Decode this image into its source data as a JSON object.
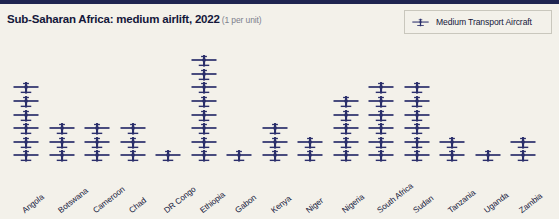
{
  "header": {
    "title": "Sub-Saharan Africa: medium airlift, 2022",
    "subtitle": "(1 per unit)"
  },
  "legend": {
    "items": [
      {
        "label": "Medium Transport Aircraft",
        "icon": "aircraft-icon",
        "color": "#2b2f6b"
      }
    ]
  },
  "colors": {
    "background": "#f3f1ea",
    "icon": "#2b2f6b",
    "title": "#14173a",
    "subtitle": "#7d7f8c",
    "top_rule": "#1f2450",
    "legend_border": "#c9c7bd"
  },
  "chart_data": {
    "type": "bar",
    "title": "Sub-Saharan Africa: medium airlift, 2022",
    "subtitle": "(1 per unit)",
    "unit_note": "1 per unit",
    "xlabel": "",
    "ylabel": "",
    "grid": false,
    "legend_position": "top-right",
    "pictogram_unit_value": 1,
    "pictogram_icon": "aircraft-icon",
    "categories": [
      "Angola",
      "Botswana",
      "Cameroon",
      "Chad",
      "DR Congo",
      "Ethiopia",
      "Gabon",
      "Kenya",
      "Niger",
      "Nigeria",
      "South Africa",
      "Sudan",
      "Tanzania",
      "Uganda",
      "Zambia"
    ],
    "series": [
      {
        "name": "Medium Transport Aircraft",
        "color": "#2b2f6b",
        "values": [
          6,
          3,
          3,
          3,
          1,
          8,
          1,
          3,
          2,
          5,
          6,
          6,
          2,
          1,
          2
        ]
      }
    ],
    "ylim": [
      0,
      8
    ]
  }
}
